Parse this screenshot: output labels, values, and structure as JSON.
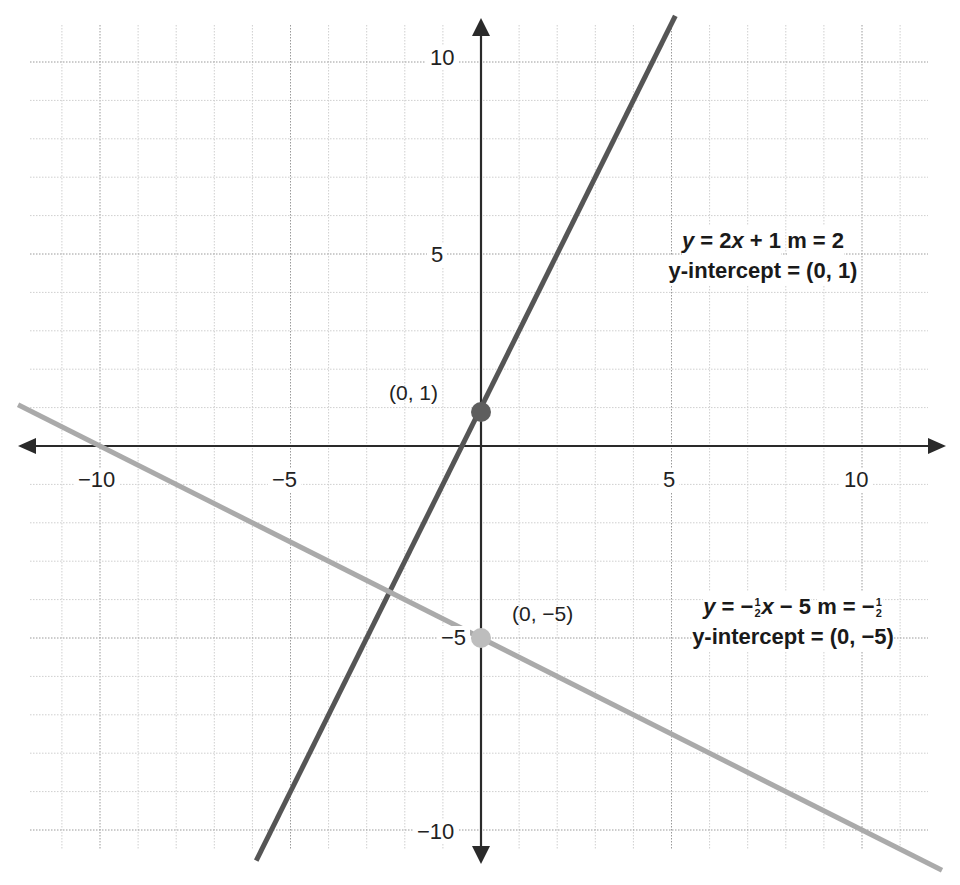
{
  "chart_data": {
    "type": "line",
    "title": "",
    "xlabel": "",
    "ylabel": "",
    "xlim": [
      -12,
      12
    ],
    "ylim": [
      -10.5,
      11
    ],
    "grid": true,
    "x_ticks": [
      -10,
      -5,
      5,
      10
    ],
    "y_ticks": [
      10,
      5,
      -5,
      -10
    ],
    "x_tick_labels": [
      "−10",
      "−5",
      "5",
      "10"
    ],
    "y_tick_labels": [
      "10",
      "5",
      "−5",
      "−10"
    ],
    "series": [
      {
        "name": "y = 2x + 1",
        "slope": 2,
        "intercept": 1,
        "color": "#555555",
        "x": [
          -11.5,
          8.9
        ],
        "y": [
          -22,
          18.8
        ],
        "label_lines": [
          "y = 2x + 1",
          "m = 2",
          "y-intercept = (0, 1)"
        ]
      },
      {
        "name": "y = -1/2 x - 5",
        "slope": -0.5,
        "intercept": -5,
        "color": "#aaaaaa",
        "x": [
          -12.2,
          12.2
        ],
        "y": [
          1.1,
          -11.1
        ],
        "label_lines": [
          "y = −½x − 5",
          "m = −½",
          "y-intercept = (0, −5)"
        ]
      }
    ],
    "annotations": [
      {
        "text": "(0, 1)",
        "x": 0,
        "y": 1,
        "color": "#666666"
      },
      {
        "text": "(0, −5)",
        "x": 0,
        "y": -5,
        "color": "#bbbbbb"
      }
    ]
  },
  "labels": {
    "x_ticks": [
      "−10",
      "−5",
      "5",
      "10"
    ],
    "y_ticks": [
      "10",
      "5",
      "−5",
      "−10"
    ],
    "point1": "(0, 1)",
    "point2": "(0, −5)",
    "eq1": {
      "y": "y",
      "rest": " = 2",
      "x": "x",
      "tail": " + 1",
      "slope": "m = 2",
      "intercept": "y-intercept = (0, 1)"
    },
    "eq2": {
      "y": "y",
      "eqpart": " = −",
      "num": "1",
      "den": "2",
      "x": "x",
      "tail": " − 5",
      "slope_pre": "m = −",
      "intercept": "y-intercept = (0, −5)"
    }
  }
}
